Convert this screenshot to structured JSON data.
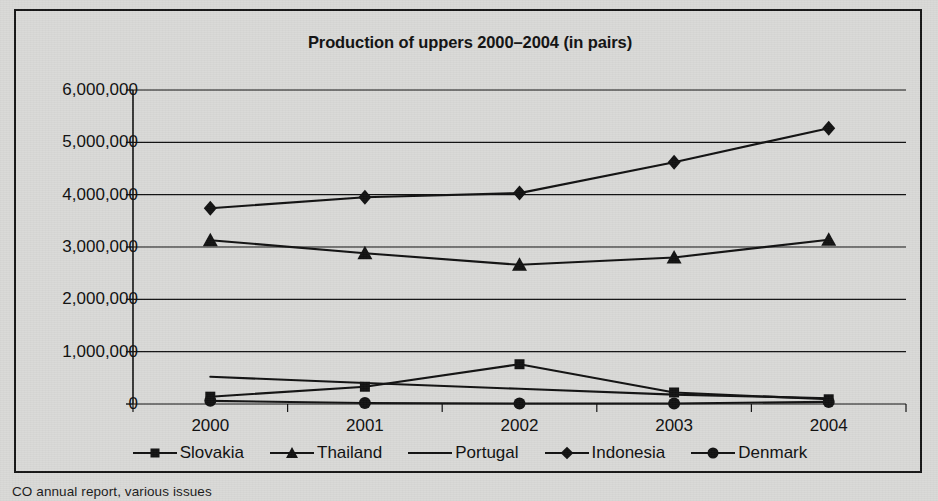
{
  "figure": {
    "caption": "CO annual report, various issues",
    "background_color": "#d9d9d7",
    "ink_color": "#111111"
  },
  "chart_data": {
    "type": "line",
    "title": "Production of uppers 2000–2004 (in pairs)",
    "xlabel": "",
    "ylabel": "",
    "categories": [
      "2000",
      "2001",
      "2002",
      "2003",
      "2004"
    ],
    "x_tick_labels": [
      "2000",
      "2001",
      "2002",
      "2003",
      "2004"
    ],
    "y_tick_labels": [
      "6,000,000",
      "5,000,000",
      "4,000,000",
      "3,000,000",
      "2,000,000",
      "1,000,000",
      "0"
    ],
    "y_tick_values": [
      6000000,
      5000000,
      4000000,
      3000000,
      2000000,
      1000000,
      0
    ],
    "ylim": [
      0,
      6000000
    ],
    "grid": "horizontal",
    "legend_position": "bottom",
    "series": [
      {
        "name": "Slovakia",
        "marker": "square",
        "values": [
          140000,
          330000,
          760000,
          220000,
          90000
        ]
      },
      {
        "name": "Thailand",
        "marker": "triangle",
        "values": [
          3130000,
          2880000,
          2660000,
          2800000,
          3140000
        ]
      },
      {
        "name": "Portugal",
        "marker": "none",
        "values": [
          520000,
          400000,
          290000,
          180000,
          110000
        ]
      },
      {
        "name": "Indonesia",
        "marker": "diamond",
        "values": [
          3740000,
          3950000,
          4030000,
          4620000,
          5270000
        ]
      },
      {
        "name": "Denmark",
        "marker": "circle",
        "values": [
          60000,
          20000,
          10000,
          10000,
          40000
        ]
      }
    ]
  }
}
